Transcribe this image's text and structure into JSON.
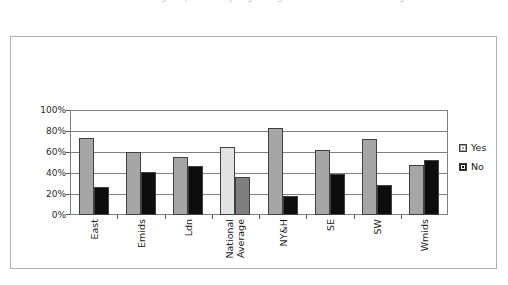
{
  "title_clipped": "Chart showing responses by region against the national average",
  "legend": {
    "position": "right",
    "entries": [
      {
        "label": "Yes",
        "color": "#a6a6a6",
        "swatch": "square-swatch-gray"
      },
      {
        "label": "No",
        "color": "#0d0d0d",
        "swatch": "square-swatch-black"
      }
    ]
  },
  "axes": {
    "y_ticks": [
      "100%",
      "80%",
      "60%",
      "40%",
      "20%",
      "0%"
    ],
    "x_categories": [
      "East",
      "Emids",
      "Ldn",
      "National Average",
      "NY&H",
      "SE",
      "SW",
      "Wmids"
    ]
  },
  "highlight": {
    "category": "National Average",
    "yes_color": "#e2e2e2",
    "no_color": "#7f7f7f"
  },
  "chart_data": {
    "type": "bar",
    "title": "",
    "xlabel": "",
    "ylabel": "",
    "ylim": [
      0,
      100
    ],
    "ytick_format": "percent",
    "ytick_values": [
      0,
      20,
      40,
      60,
      80,
      100
    ],
    "grid": true,
    "legend_position": "right",
    "categories": [
      "East",
      "Emids",
      "Ldn",
      "National Average",
      "NY&H",
      "SE",
      "SW",
      "Wmids"
    ],
    "series": [
      {
        "name": "Yes",
        "color": "#a6a6a6",
        "values": [
          73,
          60,
          55,
          65,
          83,
          62,
          72,
          48
        ]
      },
      {
        "name": "No",
        "color": "#0d0d0d",
        "values": [
          27,
          41,
          47,
          36,
          18,
          39,
          29,
          52
        ]
      }
    ]
  }
}
